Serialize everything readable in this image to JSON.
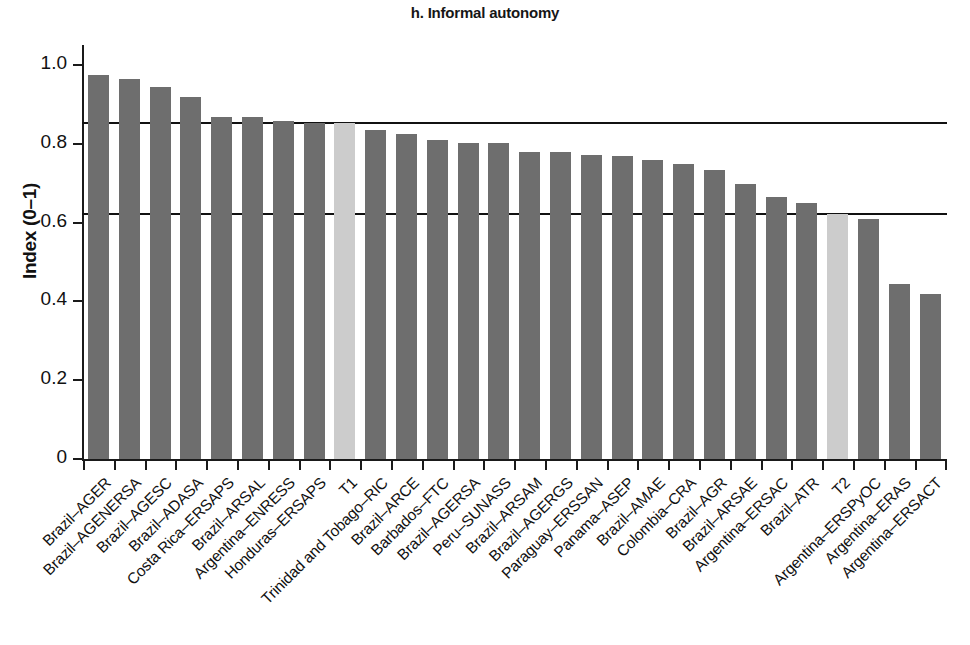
{
  "chart_data": {
    "type": "bar",
    "title": "h. Informal autonomy",
    "xlabel": "",
    "ylabel": "Index (0–1)",
    "ylim": [
      0,
      1.05
    ],
    "yticks": [
      0,
      0.2,
      0.4,
      0.6,
      0.8,
      1.0
    ],
    "ytick_labels": [
      "0",
      "0.2",
      "0.4",
      "0.6",
      "0.8",
      "1.0"
    ],
    "grid": false,
    "legend": "none",
    "reference_lines": [
      {
        "name": "T1",
        "value": 0.853
      },
      {
        "name": "T2",
        "value": 0.623
      }
    ],
    "categories": [
      "Brazil–AGER",
      "Brazil–AGENERSA",
      "Brazil–AGESC",
      "Brazil–ADASA",
      "Costa Rica–ERSAPS",
      "Brazil–ARSAL",
      "Argentina–ENRESS",
      "Honduras–ERSAPS",
      "T1",
      "Trinidad and Tobago–RIC",
      "Brazil–ARCE",
      "Barbados–FTC",
      "Brazil–AGERSA",
      "Peru–SUNASS",
      "Brazil–ARSAM",
      "Brazil–AGERGS",
      "Paraguay–ERSSAN",
      "Panama–ASEP",
      "Brazil–AMAE",
      "Colombia–CRA",
      "Brazil–AGR",
      "Brazil–ARSAE",
      "Argentina–ERSAC",
      "Brazil–ATR",
      "T2",
      "Argentina–ERSPyOC",
      "Argentina–ERAS",
      "Argentina–ERSACT"
    ],
    "values": [
      0.975,
      0.965,
      0.945,
      0.92,
      0.868,
      0.868,
      0.858,
      0.853,
      0.853,
      0.835,
      0.825,
      0.81,
      0.803,
      0.802,
      0.778,
      0.778,
      0.772,
      0.77,
      0.758,
      0.748,
      0.733,
      0.698,
      0.665,
      0.65,
      0.623,
      0.61,
      0.445,
      0.42
    ],
    "highlighted": [
      "T1",
      "T2"
    ],
    "colors": {
      "bar": "#6e6e6e",
      "highlight_bar": "#cccccc",
      "axis": "#1a1a1a",
      "reference_line": "#111111",
      "text": "#111111"
    }
  }
}
